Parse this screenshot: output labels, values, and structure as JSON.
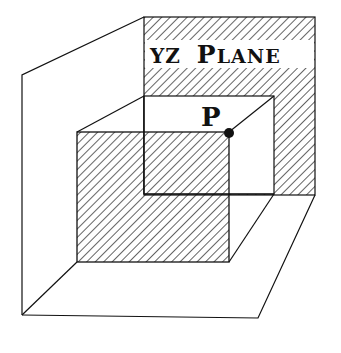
{
  "diagram": {
    "plane_label": "YZ PLANE",
    "plane_label_parts": {
      "yz": "YZ",
      "plane_initial": "P",
      "plane_rest": "LANE"
    },
    "point_label": "P",
    "colors": {
      "ink": "#111111",
      "background": "#ffffff"
    }
  }
}
